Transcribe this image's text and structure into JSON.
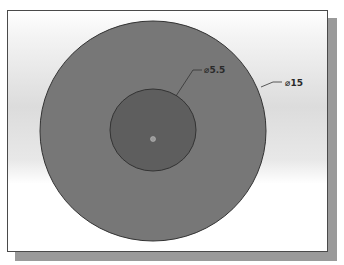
{
  "drawing": {
    "outer_circle": {
      "diameter_label": "⌀15",
      "fill": "#767676",
      "stroke": "#333333"
    },
    "inner_circle": {
      "diameter_label": "⌀5.5",
      "fill": "#5e5e5e",
      "stroke": "#333333"
    },
    "center_marker": "origin-point"
  }
}
